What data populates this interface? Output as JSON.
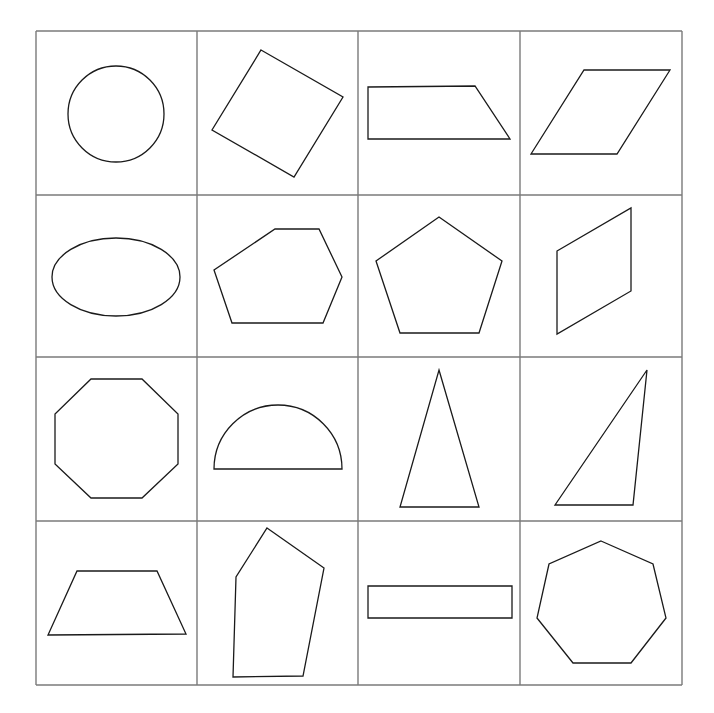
{
  "colors": {
    "background": "#ffffff",
    "grid_line": "#7a7a7a",
    "shape_stroke": "#1a1a1a"
  },
  "grid": {
    "rows": 4,
    "cols": 4,
    "x_lines": [
      36,
      197,
      358,
      520,
      682
    ],
    "y_lines": [
      31,
      195,
      357,
      521,
      685
    ]
  },
  "cells": [
    {
      "row": 0,
      "col": 0,
      "shape": "circle",
      "type": "circle",
      "cx": 116,
      "cy": 114,
      "r": 48
    },
    {
      "row": 0,
      "col": 1,
      "shape": "rotated-square",
      "type": "polygon",
      "points": "261,50 343,97 294,177 212,130"
    },
    {
      "row": 0,
      "col": 2,
      "shape": "right-trapezoid",
      "type": "polygon",
      "points": "368,87 475,86 510,139 368,139"
    },
    {
      "row": 0,
      "col": 3,
      "shape": "parallelogram",
      "type": "polygon",
      "points": "584,70 670,70 617,154 531,154"
    },
    {
      "row": 1,
      "col": 0,
      "shape": "ellipse",
      "type": "ellipse",
      "cx": 116,
      "cy": 277,
      "rx": 64,
      "ry": 39
    },
    {
      "row": 1,
      "col": 1,
      "shape": "irregular-hexagon",
      "type": "polygon",
      "points": "275,229 319,229 342,277 323,323 232,323 214,270"
    },
    {
      "row": 1,
      "col": 2,
      "shape": "regular-pentagon",
      "type": "polygon",
      "points": "439,217 502,261 479,333 400,333 376,261"
    },
    {
      "row": 1,
      "col": 3,
      "shape": "slanted-parallelogram",
      "type": "polygon",
      "points": "557,251 631,208 631,291 557,334"
    },
    {
      "row": 2,
      "col": 0,
      "shape": "octagon",
      "type": "polygon",
      "points": "91,379 142,379 178,414 178,464 142,498 91,498 55,464 55,414"
    },
    {
      "row": 2,
      "col": 1,
      "shape": "semicircle",
      "type": "path",
      "d": "M214,469 A64,64 0 0 1 342,469 Z"
    },
    {
      "row": 2,
      "col": 2,
      "shape": "isosceles-triangle",
      "type": "polygon",
      "points": "439,370 479,507 400,507"
    },
    {
      "row": 2,
      "col": 3,
      "shape": "scalene-triangle",
      "type": "polygon",
      "points": "647,370 633,505 555,505"
    },
    {
      "row": 3,
      "col": 0,
      "shape": "isosceles-trapezoid",
      "type": "polygon",
      "points": "77,571 157,571 186,634 48,635"
    },
    {
      "row": 3,
      "col": 1,
      "shape": "irregular-pentagon",
      "type": "polygon",
      "points": "267,528 324,568 303,676 233,677 236,577"
    },
    {
      "row": 3,
      "col": 2,
      "shape": "thin-rectangle",
      "type": "polygon",
      "points": "368,586 512,586 512,618 368,618"
    },
    {
      "row": 3,
      "col": 3,
      "shape": "heptagon",
      "type": "polygon",
      "points": "601,541 653,564 666,618 631,663 573,663 537,618 549,564"
    }
  ]
}
